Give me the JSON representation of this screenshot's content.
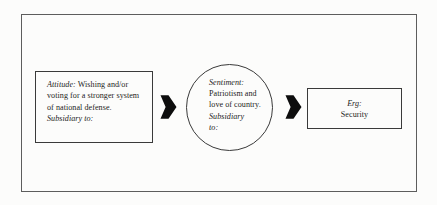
{
  "diagram": {
    "frame": {
      "border_color": "#5d5d5d"
    },
    "background_color": "#fcfcfb",
    "text_color": "#1c1c1c",
    "nodes": {
      "attitude": {
        "shape": "rectangle",
        "label_term": "Attitude:",
        "body_text": " Wishing and/or voting for a stronger system of national defense.",
        "footer_term": "Subsidiary to:"
      },
      "sentiment": {
        "shape": "circle",
        "label_term": "Sentiment:",
        "body_text": "Patriotism and love of country.",
        "footer_term_line1": "Subsidiary",
        "footer_term_line2": "to:"
      },
      "erg": {
        "shape": "rectangle",
        "label_term": "Erg:",
        "body_text": "Security"
      }
    },
    "arrows": [
      {
        "name": "attitude-to-sentiment",
        "direction": "right",
        "style": "solid-block",
        "color": "#0d0d0d"
      },
      {
        "name": "sentiment-to-erg",
        "direction": "right",
        "style": "solid-block",
        "color": "#0d0d0d"
      }
    ]
  }
}
